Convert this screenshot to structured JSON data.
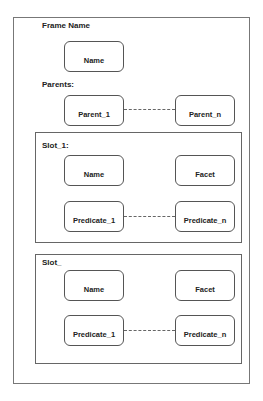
{
  "frame": {
    "title": "Frame Name",
    "name_box": "Name",
    "parents_label": "Parents:",
    "parents": [
      "Parent_1",
      "Parent_n"
    ]
  },
  "slots": [
    {
      "label": "Slot_1:",
      "name_box": "Name",
      "facet_box": "Facet",
      "predicates": [
        "Predicate_1",
        "Predicate_n"
      ]
    },
    {
      "label": "Slot_",
      "name_box": "Name",
      "facet_box": "Facet",
      "predicates": [
        "Predicate_1",
        "Predicate_n"
      ]
    }
  ]
}
